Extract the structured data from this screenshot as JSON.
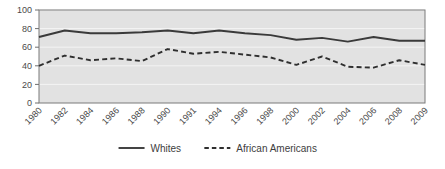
{
  "chart_data": {
    "type": "line",
    "title": "",
    "subtitle": "",
    "xlabel": "",
    "ylabel": "",
    "ylim": [
      0,
      100
    ],
    "yticks": [
      0,
      20,
      40,
      60,
      80,
      100
    ],
    "grid": true,
    "grid_axis": "y",
    "legend_position": "bottom",
    "plot_background": "#e2e2e2",
    "grid_color": "#f4f4f4",
    "axis_color": "#6e6e6e",
    "categories": [
      "1980",
      "1982",
      "1984",
      "1986",
      "1988",
      "1990",
      "1991",
      "1994",
      "1996",
      "1998",
      "2000",
      "2002",
      "2004",
      "2006",
      "2008",
      "2009"
    ],
    "series": [
      {
        "name": "Whites",
        "style": "solid",
        "color": "#3a3a3a",
        "values": [
          71,
          78,
          75,
          75,
          76,
          78,
          75,
          78,
          75,
          73,
          68,
          70,
          66,
          71,
          67,
          67
        ]
      },
      {
        "name": "African Americans",
        "style": "dashed",
        "color": "#2f2f2f",
        "values": [
          40,
          51,
          46,
          48,
          45,
          58,
          53,
          55,
          52,
          49,
          41,
          50,
          39,
          38,
          46,
          41
        ]
      }
    ]
  },
  "legend": {
    "items": [
      {
        "label": "Whites",
        "style": "solid"
      },
      {
        "label": "African Americans",
        "style": "dashed"
      }
    ]
  }
}
